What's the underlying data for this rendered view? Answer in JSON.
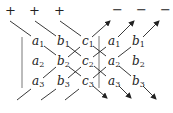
{
  "diagram": {
    "title": "",
    "signs": {
      "plus": [
        "+",
        "+",
        "+"
      ],
      "minus": [
        "−",
        "−",
        "−"
      ]
    },
    "matrix": {
      "rows": [
        [
          {
            "v": "a",
            "s": "1"
          },
          {
            "v": "b",
            "s": "1"
          },
          {
            "v": "c",
            "s": "1"
          },
          {
            "v": "a",
            "s": "1"
          },
          {
            "v": "b",
            "s": "1"
          }
        ],
        [
          {
            "v": "a",
            "s": "2"
          },
          {
            "v": "b",
            "s": "2"
          },
          {
            "v": "c",
            "s": "2"
          },
          {
            "v": "a",
            "s": "2"
          },
          {
            "v": "b",
            "s": "2"
          }
        ],
        [
          {
            "v": "a",
            "s": "3"
          },
          {
            "v": "b",
            "s": "3"
          },
          {
            "v": "c",
            "s": "3"
          },
          {
            "v": "a",
            "s": "3"
          },
          {
            "v": "b",
            "s": "3"
          }
        ]
      ]
    },
    "line_color": "#222222"
  }
}
